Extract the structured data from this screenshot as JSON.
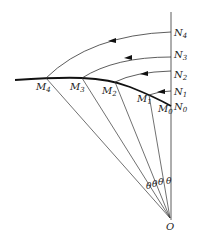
{
  "diagram": {
    "origin_label": "O",
    "angle_label": "θ",
    "n_points": [
      {
        "base": "N",
        "sub": "4"
      },
      {
        "base": "N",
        "sub": "3"
      },
      {
        "base": "N",
        "sub": "2"
      },
      {
        "base": "N",
        "sub": "1"
      },
      {
        "base": "N",
        "sub": "0"
      }
    ],
    "m_points": [
      {
        "base": "M",
        "sub": "4"
      },
      {
        "base": "M",
        "sub": "3"
      },
      {
        "base": "M",
        "sub": "2"
      },
      {
        "base": "M",
        "sub": "1"
      },
      {
        "base": "M",
        "sub": "0"
      }
    ],
    "angles": [
      "θ",
      "θ",
      "θ",
      "θ"
    ]
  }
}
